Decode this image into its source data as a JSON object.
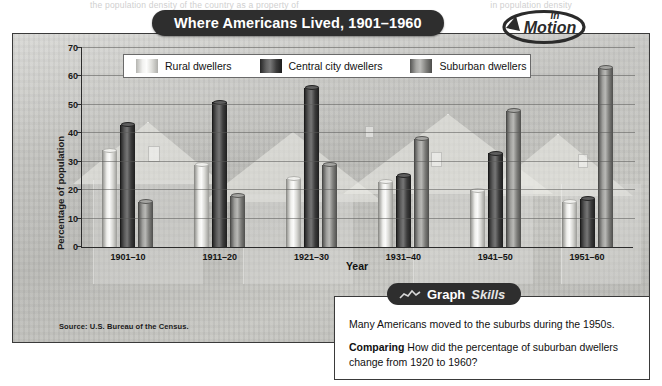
{
  "ghost": {
    "left": "the population density of the country as a property of",
    "right": "in population density"
  },
  "banner": {
    "title": "Where Americans Lived, 1901–1960"
  },
  "logo": {
    "line1": "In",
    "line2": "Motion",
    "icon": "circular-arrow-icon"
  },
  "legend": {
    "items": [
      {
        "label": "Rural dwellers",
        "key": "rural",
        "color": "#f2f2f0"
      },
      {
        "label": "Central city dwellers",
        "key": "central",
        "color": "#3d3d3d"
      },
      {
        "label": "Suburban dwellers",
        "key": "suburban",
        "color": "#8e8e8b"
      }
    ]
  },
  "source": "Source: U.S. Bureau of the Census.",
  "skills": {
    "tab_word1": "Graph",
    "tab_word2": "Skills",
    "tab_icon": "mini-chart-icon",
    "statement": "Many Americans moved to the suburbs during the 1950s.",
    "question_lead": "Comparing",
    "question": "How did the percentage of suburban dwellers change from 1920 to 1960?"
  },
  "chart_data": {
    "type": "bar",
    "title": "Where Americans Lived, 1901–1960",
    "xlabel": "Year",
    "ylabel": "Percentage of population",
    "ylim": [
      0,
      70
    ],
    "yticks": [
      0,
      10,
      20,
      30,
      40,
      50,
      60,
      70
    ],
    "grid": true,
    "legend_position": "top-inside",
    "categories": [
      "1901–10",
      "1911–20",
      "1921–30",
      "1931–40",
      "1941–50",
      "1951–60"
    ],
    "series": [
      {
        "name": "Rural dwellers",
        "values": [
          34,
          29,
          24,
          23,
          20,
          16
        ]
      },
      {
        "name": "Central city dwellers",
        "values": [
          43,
          51,
          56,
          25,
          33,
          17
        ]
      },
      {
        "name": "Suburban dwellers",
        "values": [
          16,
          18,
          29,
          38,
          48,
          63
        ]
      }
    ],
    "source": "Source: U.S. Bureau of the Census."
  }
}
